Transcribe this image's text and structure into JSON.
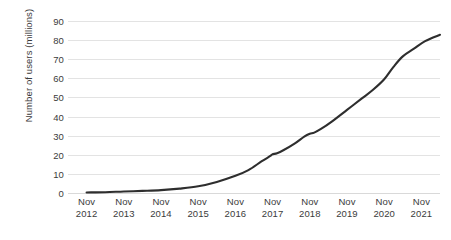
{
  "chart_data": {
    "type": "line",
    "title": "",
    "xlabel": "",
    "ylabel": "Number of users (millions)",
    "ylim": [
      0,
      90
    ],
    "y_ticks": [
      0,
      10,
      20,
      30,
      40,
      50,
      60,
      70,
      80,
      90
    ],
    "grid": true,
    "legend": "none",
    "line_color": "#2e2e2e",
    "gridline_color": "#e3e3e3",
    "categories": [
      "Nov 2012",
      "Nov 2013",
      "Nov 2014",
      "Nov 2015",
      "Nov 2016",
      "Nov 2017",
      "Nov 2018",
      "Nov 2019",
      "Nov 2020",
      "Nov 2021"
    ],
    "x_tick_labels": [
      {
        "month": "Nov",
        "year": "2012"
      },
      {
        "month": "Nov",
        "year": "2013"
      },
      {
        "month": "Nov",
        "year": "2014"
      },
      {
        "month": "Nov",
        "year": "2015"
      },
      {
        "month": "Nov",
        "year": "2016"
      },
      {
        "month": "Nov",
        "year": "2017"
      },
      {
        "month": "Nov",
        "year": "2018"
      },
      {
        "month": "Nov",
        "year": "2019"
      },
      {
        "month": "Nov",
        "year": "2020"
      },
      {
        "month": "Nov",
        "year": "2021"
      }
    ],
    "series": [
      {
        "name": "Number of users",
        "values": [
          0.3,
          0.8,
          1.5,
          3.5,
          9,
          21,
          33,
          47,
          66,
          83
        ],
        "points": [
          {
            "x": 0.0,
            "y": 0.3
          },
          {
            "x": 0.5,
            "y": 0.4
          },
          {
            "x": 1.0,
            "y": 0.8
          },
          {
            "x": 1.5,
            "y": 1.1
          },
          {
            "x": 2.0,
            "y": 1.5
          },
          {
            "x": 2.5,
            "y": 2.3
          },
          {
            "x": 3.0,
            "y": 3.5
          },
          {
            "x": 3.5,
            "y": 5.8
          },
          {
            "x": 4.0,
            "y": 9.0
          },
          {
            "x": 4.35,
            "y": 12.0
          },
          {
            "x": 4.7,
            "y": 16.5
          },
          {
            "x": 4.95,
            "y": 19.5
          },
          {
            "x": 5.0,
            "y": 20.3
          },
          {
            "x": 5.12,
            "y": 20.8
          },
          {
            "x": 5.3,
            "y": 22.5
          },
          {
            "x": 5.6,
            "y": 26.0
          },
          {
            "x": 5.85,
            "y": 29.5
          },
          {
            "x": 6.0,
            "y": 31.0
          },
          {
            "x": 6.12,
            "y": 31.6
          },
          {
            "x": 6.3,
            "y": 33.5
          },
          {
            "x": 6.6,
            "y": 37.5
          },
          {
            "x": 7.0,
            "y": 43.5
          },
          {
            "x": 7.4,
            "y": 49.5
          },
          {
            "x": 7.7,
            "y": 54.0
          },
          {
            "x": 8.0,
            "y": 59.5
          },
          {
            "x": 8.25,
            "y": 66.0
          },
          {
            "x": 8.5,
            "y": 71.5
          },
          {
            "x": 8.8,
            "y": 75.5
          },
          {
            "x": 9.1,
            "y": 79.5
          },
          {
            "x": 9.5,
            "y": 82.8
          }
        ]
      }
    ]
  }
}
